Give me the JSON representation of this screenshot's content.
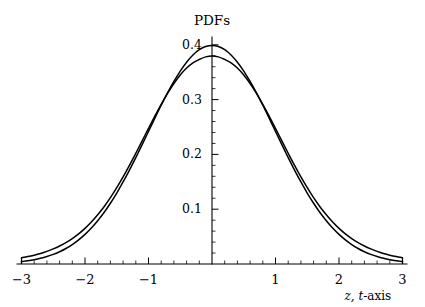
{
  "chart_data": {
    "type": "line",
    "title": "PDFs",
    "xlabel": "z, t-axis",
    "ylabel": "",
    "xlim": [
      -3,
      3
    ],
    "ylim": [
      0,
      0.42
    ],
    "grid": false,
    "legend": "none",
    "background_color": "#ffffff",
    "line_color": "#000000",
    "xticks": [
      -3,
      -2,
      -1,
      1,
      2,
      3
    ],
    "xtick_labels": [
      "-3",
      "-2",
      "-1",
      "1",
      "2",
      "3"
    ],
    "yticks": [
      0.1,
      0.2,
      0.3,
      0.4
    ],
    "ytick_labels": [
      "0.1",
      "0.2",
      "0.3",
      "0.4"
    ],
    "x_minor_tick_step": 0.2,
    "y_minor_tick_step": 0.02,
    "axis_position": "zero-crossing",
    "series": [
      {
        "name": "standard normal PDF",
        "peak": 0.3989,
        "values": [
          0.0044,
          0.006,
          0.0079,
          0.0104,
          0.0136,
          0.0175,
          0.0224,
          0.0283,
          0.0355,
          0.044,
          0.054,
          0.0656,
          0.079,
          0.094,
          0.1109,
          0.1295,
          0.1497,
          0.1714,
          0.1942,
          0.2179,
          0.242,
          0.2661,
          0.2897,
          0.3123,
          0.3332,
          0.3521,
          0.3683,
          0.3814,
          0.391,
          0.397,
          0.3989,
          0.397,
          0.391,
          0.3814,
          0.3683,
          0.3521,
          0.3332,
          0.3123,
          0.2897,
          0.2661,
          0.242,
          0.2179,
          0.1942,
          0.1714,
          0.1497,
          0.1295,
          0.1109,
          0.094,
          0.079,
          0.0656,
          0.054,
          0.044,
          0.0355,
          0.0283,
          0.0224,
          0.0175,
          0.0136,
          0.0104,
          0.0079,
          0.006,
          0.0044
        ]
      },
      {
        "name": "Student t PDF",
        "peak": 0.3796,
        "values": [
          0.0114,
          0.0135,
          0.0161,
          0.0192,
          0.023,
          0.0275,
          0.0328,
          0.0391,
          0.0465,
          0.0551,
          0.0651,
          0.0766,
          0.0898,
          0.1046,
          0.1211,
          0.1393,
          0.159,
          0.18,
          0.2021,
          0.2247,
          0.2475,
          0.2699,
          0.2914,
          0.3114,
          0.3294,
          0.3449,
          0.3576,
          0.3671,
          0.3733,
          0.378,
          0.3796,
          0.378,
          0.3733,
          0.3671,
          0.3576,
          0.3449,
          0.3294,
          0.3114,
          0.2914,
          0.2699,
          0.2475,
          0.2247,
          0.2021,
          0.18,
          0.159,
          0.1393,
          0.1211,
          0.1046,
          0.0898,
          0.0766,
          0.0651,
          0.0551,
          0.0465,
          0.0391,
          0.0328,
          0.0275,
          0.023,
          0.0192,
          0.0161,
          0.0135,
          0.0114
        ]
      }
    ],
    "x": [
      -3.0,
      -2.9,
      -2.8,
      -2.7,
      -2.6,
      -2.5,
      -2.4,
      -2.3,
      -2.2,
      -2.1,
      -2.0,
      -1.9,
      -1.8,
      -1.7,
      -1.6,
      -1.5,
      -1.4,
      -1.3,
      -1.2,
      -1.1,
      -1.0,
      -0.9,
      -0.8,
      -0.7,
      -0.6,
      -0.5,
      -0.4,
      -0.3,
      -0.2,
      -0.1,
      0.0,
      0.1,
      0.2,
      0.3,
      0.4,
      0.5,
      0.6,
      0.7,
      0.8,
      0.9,
      1.0,
      1.1,
      1.2,
      1.3,
      1.4,
      1.5,
      1.6,
      1.7,
      1.8,
      1.9,
      2.0,
      2.1,
      2.2,
      2.3,
      2.4,
      2.5,
      2.6,
      2.7,
      2.8,
      2.9,
      3.0
    ],
    "annotations": [
      "Two probability density functions overlaid: the narrower taller curve is the standard normal; the lower-peaked curve with heavier tails is a Student t distribution; they cross near z = ±1.5."
    ]
  }
}
